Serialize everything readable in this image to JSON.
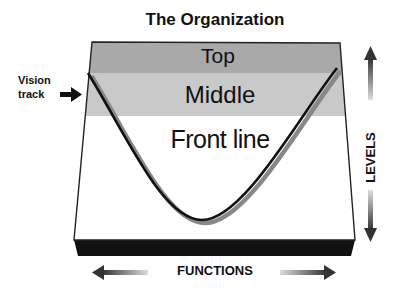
{
  "title": "The Organization",
  "bands": [
    {
      "label": "Top",
      "color": "#a9a9a9"
    },
    {
      "label": "Middle",
      "color": "#c9c9c9"
    },
    {
      "label": "Front line",
      "color": "#ffffff"
    }
  ],
  "vision_track": {
    "label": "Vision track",
    "line1": "Vision",
    "line2": "track",
    "icon": "arrow-right-icon"
  },
  "axes": {
    "vertical": {
      "label": "LEVELS",
      "icons": [
        "arrow-up-icon",
        "arrow-down-icon"
      ]
    },
    "horizontal": {
      "label": "FUNCTIONS",
      "icons": [
        "arrow-left-icon",
        "arrow-right-icon"
      ]
    }
  },
  "colors": {
    "base": "#111111",
    "curve": "#111111",
    "outline": "#222222"
  }
}
